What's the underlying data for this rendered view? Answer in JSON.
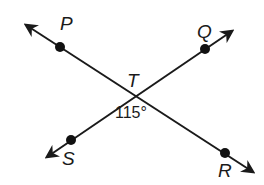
{
  "diagram": {
    "type": "intersecting-lines",
    "intersection_point": {
      "label": "T",
      "x": 135,
      "y": 96
    },
    "lines": [
      {
        "name": "line-PR",
        "start": {
          "x": 26,
          "y": 25
        },
        "end": {
          "x": 253,
          "y": 172
        },
        "arrows": "both"
      },
      {
        "name": "line-SQ",
        "start": {
          "x": 47,
          "y": 157
        },
        "end": {
          "x": 232,
          "y": 31
        },
        "arrows": "both"
      }
    ],
    "points": [
      {
        "label": "P",
        "x": 60,
        "y": 47,
        "label_x": 60,
        "label_y": 30
      },
      {
        "label": "Q",
        "x": 205,
        "y": 49,
        "label_x": 197,
        "label_y": 38
      },
      {
        "label": "S",
        "x": 71,
        "y": 140,
        "label_x": 62,
        "label_y": 165
      },
      {
        "label": "R",
        "x": 225,
        "y": 153,
        "label_x": 218,
        "label_y": 177
      }
    ],
    "intersection_label": {
      "text": "T",
      "x": 127,
      "y": 87
    },
    "angle_label": {
      "text": "115°",
      "x": 115,
      "y": 118,
      "between": [
        "TS",
        "TR"
      ]
    },
    "colors": {
      "line": "#1a1a1a",
      "point": "#111111",
      "background": "#ffffff"
    }
  }
}
